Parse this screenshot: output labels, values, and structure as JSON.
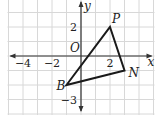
{
  "diagram": {
    "type": "coordinate-plane-triangle",
    "axes": {
      "x_label": "x",
      "y_label": "y",
      "origin_label": "O",
      "x_range": [
        -5,
        5
      ],
      "y_range": [
        -4,
        4
      ],
      "x_ticks": [
        {
          "value": -4,
          "label": "−4"
        },
        {
          "value": -2,
          "label": "−2"
        },
        {
          "value": 2,
          "label": "2"
        }
      ],
      "y_ticks": [
        {
          "value": 2,
          "label": "2"
        },
        {
          "value": -3,
          "label": "−3"
        }
      ]
    },
    "grid": {
      "step": 1,
      "color": "#d8d8d8"
    },
    "triangle": {
      "stroke": "#1a1a1a",
      "vertices": [
        {
          "name": "P",
          "x": 2,
          "y": 2
        },
        {
          "name": "N",
          "x": 3,
          "y": -1
        },
        {
          "name": "B",
          "x": -1,
          "y": -2
        }
      ]
    }
  }
}
